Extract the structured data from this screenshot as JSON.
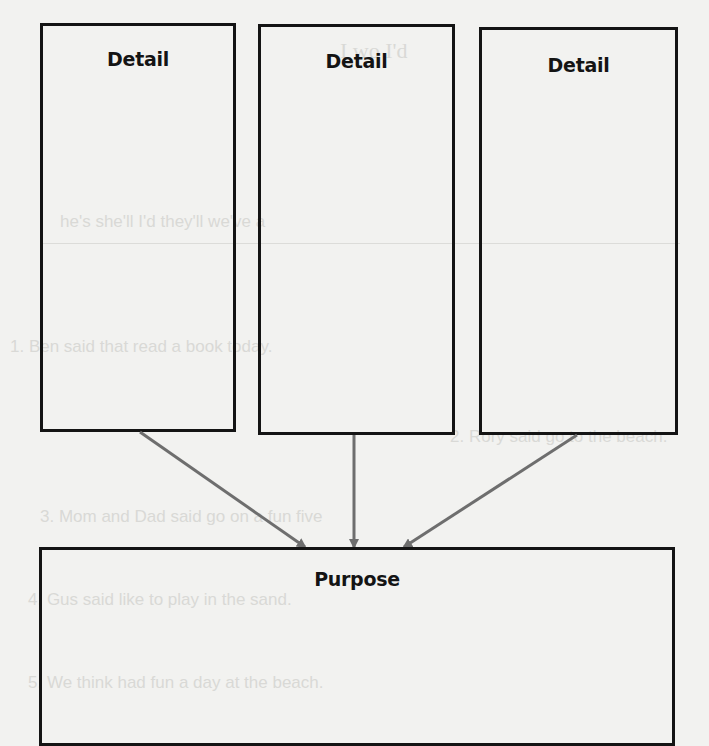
{
  "diagram": {
    "type": "graphic-organizer",
    "details": [
      {
        "label": "Detail"
      },
      {
        "label": "Detail"
      },
      {
        "label": "Detail"
      }
    ],
    "purpose": {
      "label": "Purpose"
    },
    "colors": {
      "box_border": "#141414",
      "arrow": "#6e6e6e",
      "background": "#f2f2f0"
    }
  },
  "bleed_through": {
    "lines": [
      "I wo          I'd",
      "he's      she'll       I'd       they'll      we've a",
      "1. Ben said that               read a book today.",
      "2. Rory said                  go to the beach.",
      "3. Mom and Dad said               go on a fun five",
      "4. Gus said                   like to play in the sand.",
      "5. We think                  had fun a day at the beach."
    ]
  }
}
